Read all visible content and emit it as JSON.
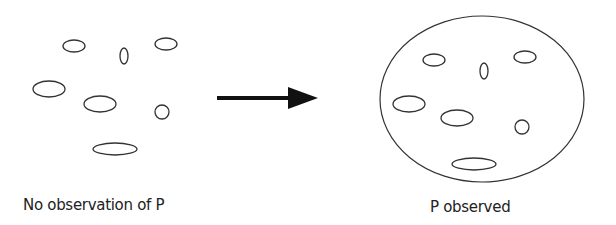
{
  "diagram": {
    "left_panel": {
      "label": "No observation of P",
      "ellipses": [
        {
          "cx": 74,
          "cy": 46,
          "rx": 11,
          "ry": 6
        },
        {
          "cx": 124,
          "cy": 56,
          "rx": 4,
          "ry": 8
        },
        {
          "cx": 166,
          "cy": 44,
          "rx": 11,
          "ry": 6
        },
        {
          "cx": 49,
          "cy": 89,
          "rx": 16,
          "ry": 8
        },
        {
          "cx": 100,
          "cy": 104,
          "rx": 16,
          "ry": 8
        },
        {
          "cx": 162,
          "cy": 112,
          "rx": 7,
          "ry": 7
        },
        {
          "cx": 115,
          "cy": 149,
          "rx": 22,
          "ry": 6
        }
      ]
    },
    "arrow": {
      "x1": 217,
      "y1": 98,
      "x2": 318,
      "y2": 98,
      "color": "#111111"
    },
    "right_panel": {
      "label": "P observed",
      "boundary": {
        "cx": 482,
        "cy": 99,
        "rx": 102,
        "ry": 83
      },
      "ellipses": [
        {
          "cx": 434,
          "cy": 60,
          "rx": 11,
          "ry": 6
        },
        {
          "cx": 484,
          "cy": 71,
          "rx": 4,
          "ry": 8
        },
        {
          "cx": 525,
          "cy": 57,
          "rx": 11,
          "ry": 6
        },
        {
          "cx": 409,
          "cy": 104,
          "rx": 16,
          "ry": 8
        },
        {
          "cx": 457,
          "cy": 118,
          "rx": 16,
          "ry": 8
        },
        {
          "cx": 522,
          "cy": 127,
          "rx": 7,
          "ry": 7
        },
        {
          "cx": 474,
          "cy": 164,
          "rx": 22,
          "ry": 6
        }
      ]
    },
    "stroke_color": "#333333"
  }
}
